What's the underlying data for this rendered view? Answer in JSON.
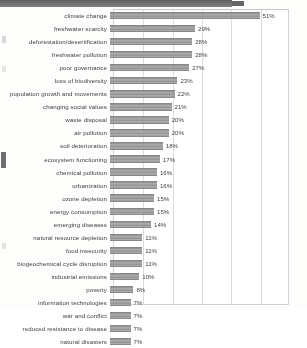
{
  "chart_data": {
    "type": "bar",
    "orientation": "horizontal",
    "title": "",
    "xlabel": "",
    "ylabel": "",
    "xlim": [
      0,
      60
    ],
    "grid": true,
    "legend": false,
    "value_suffix": "%",
    "categories": [
      "climate change",
      "freshwater scarcity",
      "deforestation/desertification",
      "freshwater pollution",
      "poor governance",
      "loss of biodiversity",
      "population growth and movements",
      "changing social values",
      "waste disposal",
      "air pollution",
      "soil deterioration",
      "ecosystem functioning",
      "chemical pollution",
      "urbanization",
      "ozone depletion",
      "energy consumption",
      "emerging diseases",
      "natural resource depletion",
      "food insecurity",
      "biogeochemical cycle disruption",
      "industrial emissions",
      "poverty",
      "information technologies",
      "war and conflict",
      "reduced resistance to disease",
      "natural disasters"
    ],
    "values": [
      51,
      29,
      28,
      28,
      27,
      23,
      22,
      21,
      20,
      20,
      18,
      17,
      16,
      16,
      15,
      15,
      14,
      11,
      11,
      11,
      10,
      8,
      7,
      7,
      7,
      7
    ],
    "value_labels": [
      "51%",
      "29%",
      "28%",
      "28%",
      "27%",
      "23%",
      "22%",
      "21%",
      "20%",
      "20%",
      "18%",
      "17%",
      "16%",
      "16%",
      "15%",
      "15%",
      "14%",
      "11%",
      "11%",
      "11%",
      "10%",
      "8%",
      "7%",
      "7%",
      "7%",
      "7%"
    ],
    "gridline_values": [
      10,
      20,
      30,
      40,
      50
    ],
    "bar_color": "#9a9a9a",
    "grid_color": "#dcdcdc",
    "text_color": "#3b3b3b"
  }
}
